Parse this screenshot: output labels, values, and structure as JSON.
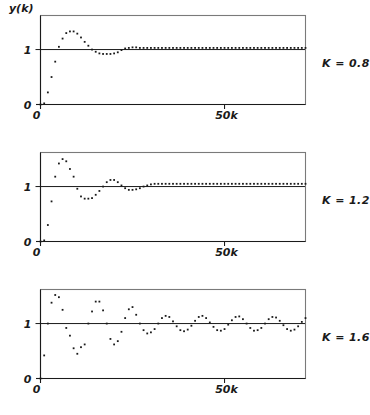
{
  "figure": {
    "ylabel": "y(k)",
    "xtick_label_0": "0",
    "xtick_label_50": "50k",
    "ytick_label_0": "0",
    "ytick_label_1": "1",
    "ink_color": "#1a1a1a",
    "frame_color": "#7a7a7a",
    "background": "#ffffff"
  },
  "chart_data": [
    {
      "type": "scatter",
      "title": "",
      "label": "K = 0.8",
      "xlabel": "50k",
      "ylabel": "y(k)",
      "xlim": [
        0,
        72
      ],
      "ylim": [
        0,
        1.62
      ],
      "xticks": [
        0,
        50
      ],
      "xticklabels": [
        "0",
        "50k"
      ],
      "yticks": [
        0,
        1
      ],
      "yticklabels": [
        "0",
        "1"
      ],
      "grid": false,
      "legend": "right-outside",
      "reference_line_y": 1,
      "x": [
        0,
        1,
        2,
        3,
        4,
        5,
        6,
        7,
        8,
        9,
        10,
        11,
        12,
        13,
        14,
        15,
        16,
        17,
        18,
        19,
        20,
        21,
        22,
        23,
        24,
        25,
        26,
        27,
        28,
        29,
        30,
        31,
        32,
        33,
        34,
        35,
        36,
        37,
        38,
        39,
        40,
        41,
        42,
        43,
        44,
        45,
        46,
        47,
        48,
        49,
        50,
        51,
        52,
        53,
        54,
        55,
        56,
        57,
        58,
        59,
        60,
        61,
        62,
        63,
        64,
        65,
        66,
        67,
        68,
        69,
        70,
        71,
        72
      ],
      "y": [
        0.0,
        0.02,
        0.22,
        0.5,
        0.78,
        1.05,
        1.2,
        1.3,
        1.33,
        1.33,
        1.29,
        1.22,
        1.14,
        1.07,
        1.0,
        0.96,
        0.93,
        0.92,
        0.92,
        0.92,
        0.93,
        0.95,
        0.99,
        1.02,
        1.03,
        1.04,
        1.04,
        1.03,
        1.03,
        1.03,
        1.03,
        1.03,
        1.03,
        1.03,
        1.03,
        1.03,
        1.03,
        1.03,
        1.03,
        1.03,
        1.03,
        1.03,
        1.03,
        1.03,
        1.03,
        1.03,
        1.03,
        1.03,
        1.03,
        1.03,
        1.03,
        1.03,
        1.03,
        1.03,
        1.03,
        1.03,
        1.03,
        1.03,
        1.03,
        1.03,
        1.03,
        1.03,
        1.03,
        1.03,
        1.03,
        1.03,
        1.03,
        1.03,
        1.03,
        1.03,
        1.03,
        1.03,
        1.03
      ]
    },
    {
      "type": "scatter",
      "title": "",
      "label": "K = 1.2",
      "xlabel": "50k",
      "ylabel": "y(k)",
      "xlim": [
        0,
        72
      ],
      "ylim": [
        0,
        1.62
      ],
      "xticks": [
        0,
        50
      ],
      "xticklabels": [
        "0",
        "50k"
      ],
      "yticks": [
        0,
        1
      ],
      "yticklabels": [
        "0",
        "1"
      ],
      "grid": false,
      "legend": "right-outside",
      "reference_line_y": 1,
      "x": [
        0,
        1,
        2,
        3,
        4,
        5,
        6,
        7,
        8,
        9,
        10,
        11,
        12,
        13,
        14,
        15,
        16,
        17,
        18,
        19,
        20,
        21,
        22,
        23,
        24,
        25,
        26,
        27,
        28,
        29,
        30,
        31,
        32,
        33,
        34,
        35,
        36,
        37,
        38,
        39,
        40,
        41,
        42,
        43,
        44,
        45,
        46,
        47,
        48,
        49,
        50,
        51,
        52,
        53,
        54,
        55,
        56,
        57,
        58,
        59,
        60,
        61,
        62,
        63,
        64,
        65,
        66,
        67,
        68,
        69,
        70,
        71,
        72
      ],
      "y": [
        0.0,
        0.02,
        0.3,
        0.73,
        1.18,
        1.42,
        1.5,
        1.46,
        1.32,
        1.18,
        0.96,
        0.82,
        0.78,
        0.78,
        0.79,
        0.85,
        0.92,
        1.0,
        1.08,
        1.12,
        1.12,
        1.08,
        1.02,
        0.97,
        0.94,
        0.94,
        0.95,
        0.97,
        1.0,
        1.02,
        1.04,
        1.05,
        1.05,
        1.05,
        1.05,
        1.05,
        1.05,
        1.05,
        1.05,
        1.05,
        1.05,
        1.05,
        1.05,
        1.05,
        1.05,
        1.05,
        1.05,
        1.05,
        1.05,
        1.05,
        1.05,
        1.05,
        1.05,
        1.05,
        1.05,
        1.05,
        1.05,
        1.05,
        1.05,
        1.05,
        1.05,
        1.05,
        1.05,
        1.05,
        1.05,
        1.05,
        1.05,
        1.05,
        1.05,
        1.05,
        1.05,
        1.05,
        1.05
      ]
    },
    {
      "type": "scatter",
      "title": "",
      "label": "K = 1.6",
      "xlabel": "50k",
      "ylabel": "y(k)",
      "xlim": [
        0,
        72
      ],
      "ylim": [
        0,
        1.62
      ],
      "xticks": [
        0,
        50
      ],
      "xticklabels": [
        "0",
        "50k"
      ],
      "yticks": [
        0,
        1
      ],
      "yticklabels": [
        "0",
        "1"
      ],
      "grid": false,
      "legend": "right-outside",
      "reference_line_y": 1,
      "x": [
        0,
        1,
        2,
        3,
        4,
        5,
        6,
        7,
        8,
        9,
        10,
        11,
        12,
        13,
        14,
        15,
        16,
        17,
        18,
        19,
        20,
        21,
        22,
        23,
        24,
        25,
        26,
        27,
        28,
        29,
        30,
        31,
        32,
        33,
        34,
        35,
        36,
        37,
        38,
        39,
        40,
        41,
        42,
        43,
        44,
        45,
        46,
        47,
        48,
        49,
        50,
        51,
        52,
        53,
        54,
        55,
        56,
        57,
        58,
        59,
        60,
        61,
        62,
        63,
        64,
        65,
        66,
        67,
        68,
        69,
        70,
        71,
        72
      ],
      "y": [
        0.0,
        0.42,
        1.0,
        1.38,
        1.52,
        1.48,
        1.25,
        0.92,
        0.78,
        0.55,
        0.45,
        0.57,
        0.62,
        1.0,
        1.22,
        1.4,
        1.4,
        1.24,
        1.0,
        0.72,
        0.62,
        0.68,
        0.85,
        1.1,
        1.26,
        1.3,
        1.16,
        1.0,
        0.88,
        0.82,
        0.84,
        0.9,
        1.0,
        1.1,
        1.14,
        1.12,
        1.04,
        0.95,
        0.88,
        0.86,
        0.89,
        0.96,
        1.05,
        1.12,
        1.14,
        1.1,
        1.02,
        0.94,
        0.88,
        0.87,
        0.9,
        0.98,
        1.06,
        1.12,
        1.13,
        1.08,
        1.0,
        0.92,
        0.87,
        0.88,
        0.92,
        1.0,
        1.08,
        1.12,
        1.11,
        1.05,
        0.97,
        0.9,
        0.87,
        0.89,
        0.95,
        1.03,
        1.1
      ]
    }
  ]
}
